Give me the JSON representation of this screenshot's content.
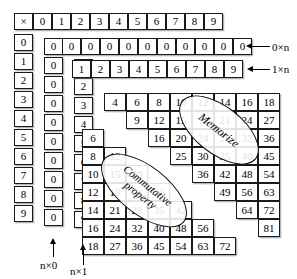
{
  "figure": {
    "operator_symbol": "×"
  },
  "header_row": {
    "name": "multiplication-header-row",
    "cells": [
      "×",
      "0",
      "1",
      "2",
      "3",
      "4",
      "5",
      "6",
      "7",
      "8",
      "9"
    ]
  },
  "left_column": {
    "name": "multiplicand-column",
    "cells": [
      "0",
      "1",
      "2",
      "3",
      "4",
      "5",
      "6",
      "7",
      "8",
      "9"
    ]
  },
  "zero_column": {
    "name": "n-times-zero-column",
    "cells": [
      "0",
      "0",
      "0",
      "0",
      "0",
      "0",
      "0",
      "0",
      "0",
      "0"
    ]
  },
  "one_column": {
    "name": "n-times-one-column",
    "cells": [
      "0",
      "1",
      "2",
      "3",
      "4",
      "5",
      "6",
      "7",
      "8",
      "9"
    ]
  },
  "staircase_rows": [
    {
      "name": "row-0-times-n",
      "label": "0×n",
      "values": [
        "0",
        "0",
        "0",
        "0",
        "0",
        "0",
        "0",
        "0",
        "0",
        "0"
      ]
    },
    {
      "name": "row-1-times-n",
      "label": "1×n",
      "values": [
        "1",
        "2",
        "3",
        "4",
        "5",
        "6",
        "7",
        "8",
        "9"
      ]
    },
    {
      "name": "row-2-times-n",
      "label": "2×n",
      "values": [
        "4",
        "6",
        "8",
        "10",
        "12",
        "14",
        "16",
        "18"
      ]
    },
    {
      "name": "row-3-times-n",
      "label": "3×n",
      "values": [
        "9",
        "12",
        "15",
        "18",
        "21",
        "24",
        "27"
      ]
    },
    {
      "name": "row-4-times-n",
      "label": "4×n",
      "values": [
        "16",
        "20",
        "24",
        "28",
        "32",
        "36"
      ]
    },
    {
      "name": "row-5-times-n",
      "label": "5×n",
      "values": [
        "25",
        "30",
        "35",
        "40",
        "45"
      ]
    },
    {
      "name": "row-6-times-n",
      "label": "6×n",
      "values": [
        "36",
        "42",
        "48",
        "54"
      ]
    },
    {
      "name": "row-7-times-n",
      "label": "7×n",
      "values": [
        "49",
        "56",
        "63"
      ]
    },
    {
      "name": "row-8-times-n",
      "label": "8×n",
      "values": [
        "64",
        "72"
      ]
    },
    {
      "name": "row-9-times-n",
      "label": "9×n",
      "values": [
        "81"
      ]
    }
  ],
  "lower_triangle_columns": [
    {
      "name": "col-n-times-2",
      "values": [
        "6",
        "8",
        "10",
        "12",
        "14",
        "16",
        "18"
      ]
    },
    {
      "name": "col-n-times-3",
      "values": [
        "12",
        "15",
        "20",
        "24",
        "27"
      ]
    },
    {
      "name": "col-n-times-4",
      "values": [
        "20",
        "24",
        "30",
        "36",
        "40",
        "45"
      ]
    }
  ],
  "lower_triangle_rows": [
    {
      "name": "lower-row-a",
      "values": [
        "6"
      ]
    },
    {
      "name": "lower-row-b",
      "values": [
        "8",
        "12"
      ]
    },
    {
      "name": "lower-row-c",
      "values": [
        "10",
        "15",
        "20"
      ]
    },
    {
      "name": "lower-row-d",
      "values": [
        "12",
        "18",
        "24",
        "30"
      ]
    },
    {
      "name": "lower-row-e",
      "values": [
        "14",
        "21",
        "28",
        "35",
        "42"
      ]
    },
    {
      "name": "lower-row-f",
      "values": [
        "16",
        "24",
        "32",
        "40",
        "48",
        "56"
      ]
    },
    {
      "name": "lower-row-g",
      "values": [
        "18",
        "27",
        "36",
        "45",
        "54",
        "63",
        "72"
      ]
    }
  ],
  "callouts": {
    "zero_times_n": "0×n",
    "one_times_n": "1×n",
    "n_times_zero": "n×0",
    "n_times_one": "n×1"
  },
  "annotations": {
    "memorize": "Memorize",
    "commutative_line1": "Commutative",
    "commutative_line2": "property"
  },
  "colors": {
    "ink": "#1a1a1a",
    "paper": "#ffffff",
    "shadow": "#787878"
  }
}
